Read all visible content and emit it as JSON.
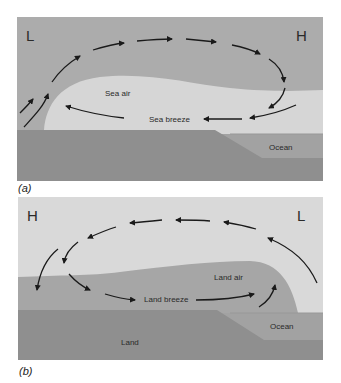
{
  "panel_a": {
    "caption": "(a)",
    "pressure_left": "L",
    "pressure_right": "H",
    "air_mass_label": "Sea air",
    "breeze_label": "Sea breeze",
    "water_label": "Ocean",
    "circulation_direction": "clockwise"
  },
  "panel_b": {
    "caption": "(b)",
    "pressure_left": "H",
    "pressure_right": "L",
    "air_mass_label": "Land air",
    "breeze_label": "Land breeze",
    "land_label": "Land",
    "water_label": "Ocean",
    "circulation_direction": "counterclockwise"
  },
  "colors": {
    "sky_dark": "#acacac",
    "sky_light": "#d9d9d9",
    "air_light": "#d6d6d6",
    "air_dark": "#a6a6a6",
    "land": "#8f8f8f",
    "ocean": "#a0a0a0",
    "arrow": "#1a1a1a"
  }
}
